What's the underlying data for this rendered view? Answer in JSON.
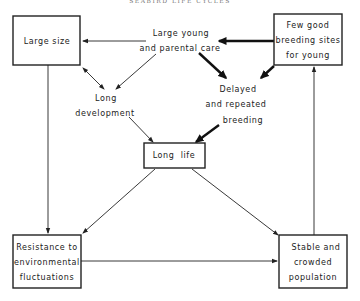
{
  "header": {
    "running_head": "SEABIRD LIFE CYCLES"
  },
  "nodes": {
    "large_size": {
      "lines": [
        "Large size"
      ],
      "boxed": true
    },
    "few_good_breeding_sites": {
      "lines": [
        "Few good",
        "breeding sites",
        "for young"
      ],
      "boxed": true
    },
    "large_young_parental_care": {
      "lines": [
        "Large young",
        "and parental care"
      ],
      "boxed": false
    },
    "long_development": {
      "lines": [
        "Long",
        "development"
      ],
      "boxed": false
    },
    "delayed_repeated_breeding": {
      "lines": [
        "Delayed",
        "and repeated",
        "breeding"
      ],
      "boxed": false
    },
    "long_life": {
      "lines": [
        "Long  life"
      ],
      "boxed": true
    },
    "resistance": {
      "lines": [
        "Resistance to",
        "environmental",
        "fluctuations"
      ],
      "boxed": true
    },
    "stable_population": {
      "lines": [
        "Stable and",
        "crowded",
        "population"
      ],
      "boxed": true
    }
  },
  "edges": [
    {
      "from": "large_young_parental_care",
      "to": "large_size",
      "weight": "thin"
    },
    {
      "from": "few_good_breeding_sites",
      "to": "large_young_parental_care",
      "weight": "thick"
    },
    {
      "from": "large_size",
      "to": "long_development",
      "weight": "thin",
      "bidirectional": true
    },
    {
      "from": "large_young_parental_care",
      "to": "long_development",
      "weight": "thin"
    },
    {
      "from": "large_young_parental_care",
      "to": "delayed_repeated_breeding",
      "weight": "thick"
    },
    {
      "from": "few_good_breeding_sites",
      "to": "delayed_repeated_breeding",
      "weight": "thick"
    },
    {
      "from": "long_development",
      "to": "long_life",
      "weight": "thin"
    },
    {
      "from": "delayed_repeated_breeding",
      "to": "long_life",
      "weight": "thick"
    },
    {
      "from": "large_size",
      "to": "resistance",
      "weight": "thin"
    },
    {
      "from": "long_life",
      "to": "resistance",
      "weight": "thin"
    },
    {
      "from": "long_life",
      "to": "stable_population",
      "weight": "thin"
    },
    {
      "from": "resistance",
      "to": "stable_population",
      "weight": "thin"
    },
    {
      "from": "stable_population",
      "to": "few_good_breeding_sites",
      "weight": "thin"
    }
  ]
}
